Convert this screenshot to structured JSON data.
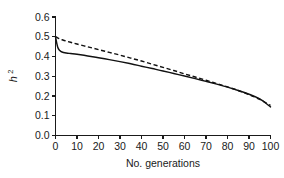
{
  "chart_data": {
    "type": "line",
    "title": "",
    "subtitle": "",
    "xlabel": "No. generations",
    "ylabel": "h²",
    "ylabel_base": "h",
    "ylabel_sup": "2",
    "xlim": [
      0,
      100
    ],
    "ylim": [
      0.0,
      0.6
    ],
    "xticks": [
      0,
      10,
      20,
      30,
      40,
      50,
      60,
      70,
      80,
      90,
      100
    ],
    "xtick_labels": [
      "0",
      "10",
      "20",
      "30",
      "40",
      "50",
      "60",
      "70",
      "80",
      "90",
      "100"
    ],
    "yticks": [
      0.0,
      0.1,
      0.2,
      0.3,
      0.4,
      0.5,
      0.6
    ],
    "ytick_labels": [
      "0.0",
      "0.1",
      "0.2",
      "0.3",
      "0.4",
      "0.5",
      "0.6"
    ],
    "grid": false,
    "legend": "none",
    "spines": [
      "left",
      "bottom"
    ],
    "background_color": "#ffffff",
    "line_color": "#111111",
    "x": [
      0,
      1,
      2,
      3,
      5,
      7,
      10,
      15,
      20,
      25,
      30,
      35,
      40,
      45,
      50,
      55,
      60,
      65,
      70,
      75,
      80,
      85,
      90,
      95,
      100
    ],
    "series": [
      {
        "name": "dashed",
        "style": "dashed",
        "values": [
          0.5,
          0.494,
          0.489,
          0.485,
          0.478,
          0.472,
          0.463,
          0.449,
          0.435,
          0.421,
          0.407,
          0.392,
          0.377,
          0.361,
          0.345,
          0.329,
          0.312,
          0.296,
          0.28,
          0.263,
          0.246,
          0.228,
          0.207,
          0.183,
          0.152
        ]
      },
      {
        "name": "solid",
        "style": "solid",
        "values": [
          0.5,
          0.448,
          0.43,
          0.423,
          0.418,
          0.415,
          0.411,
          0.403,
          0.394,
          0.384,
          0.374,
          0.363,
          0.351,
          0.339,
          0.327,
          0.314,
          0.301,
          0.288,
          0.274,
          0.26,
          0.245,
          0.228,
          0.209,
          0.185,
          0.145
        ]
      }
    ]
  }
}
